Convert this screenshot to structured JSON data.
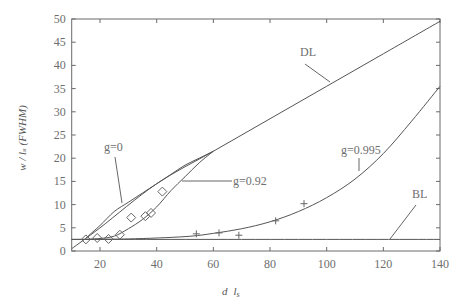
{
  "chart_data": {
    "type": "line",
    "title": "",
    "xlabel": "d / l_s",
    "ylabel": "w / l_s (FWHM)",
    "xlim": [
      10,
      140
    ],
    "ylim": [
      0,
      50
    ],
    "x_ticks": [
      20,
      40,
      60,
      80,
      100,
      120,
      140
    ],
    "y_ticks": [
      0,
      5,
      10,
      15,
      20,
      25,
      30,
      35,
      40,
      45,
      50
    ],
    "grid": false,
    "series": [
      {
        "name": "DL",
        "kind": "line",
        "x": [
          10,
          20,
          40,
          60,
          80,
          100,
          120,
          140
        ],
        "y": [
          0.5,
          5,
          14.5,
          21.5,
          28.5,
          35.5,
          42.5,
          49.5
        ]
      },
      {
        "name": "g=0",
        "kind": "line",
        "x": [
          15,
          20,
          25,
          30,
          35,
          40,
          45,
          50,
          55,
          60
        ],
        "y": [
          2.8,
          5.5,
          8.5,
          10.5,
          12.5,
          14.5,
          16.5,
          18.5,
          20,
          21.5
        ]
      },
      {
        "name": "g=0.92",
        "kind": "line",
        "x": [
          15,
          20,
          25,
          30,
          35,
          40,
          45,
          50,
          55,
          60
        ],
        "y": [
          2.5,
          2.7,
          3.2,
          4.8,
          6.8,
          9.5,
          13,
          16,
          19,
          21.5
        ]
      },
      {
        "name": "g=0.995",
        "kind": "line",
        "x": [
          10,
          30,
          50,
          60,
          70,
          80,
          90,
          100,
          110,
          120,
          130,
          140
        ],
        "y": [
          2.5,
          2.6,
          3.1,
          3.8,
          4.8,
          6.3,
          8.5,
          11.5,
          15.5,
          21,
          28,
          35.5
        ]
      },
      {
        "name": "BL",
        "kind": "line",
        "x": [
          10,
          140
        ],
        "y": [
          2.5,
          2.5
        ]
      },
      {
        "name": "g=0.92 data",
        "kind": "scatter",
        "marker": "diamond",
        "x": [
          15,
          19,
          23,
          27,
          31,
          36,
          38,
          42
        ],
        "y": [
          2.5,
          2.8,
          2.6,
          3.5,
          7.2,
          7.5,
          8.2,
          12.8
        ]
      },
      {
        "name": "g=0.995 data",
        "kind": "scatter",
        "marker": "plus",
        "x": [
          54,
          62,
          69,
          82,
          92
        ],
        "y": [
          3.7,
          3.9,
          3.4,
          6.5,
          10.2
        ]
      }
    ],
    "annotations": [
      {
        "text": "DL",
        "x": 97,
        "y": 44
      },
      {
        "text": "g=0",
        "x": 23,
        "y": 20
      },
      {
        "text": "g=0.92",
        "x": 62,
        "y": 12.8
      },
      {
        "text": "g=0.995",
        "x": 108,
        "y": 24
      },
      {
        "text": "BL",
        "x": 130,
        "y": 11
      }
    ]
  },
  "labels": {
    "xlabel_main": "d",
    "xlabel_sub": "l",
    "xlabel_subscript": "s",
    "ylabel": "w / lₛ (FWHM)",
    "annot_DL": "DL",
    "annot_g0": "g=0",
    "annot_g092": "g=0.92",
    "annot_g0995": "g=0.995",
    "annot_BL": "BL"
  }
}
